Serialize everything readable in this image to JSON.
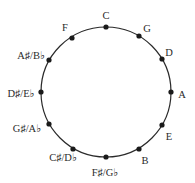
{
  "diagram": {
    "circle": {
      "cx": 106,
      "cy": 92,
      "r": 65,
      "stroke": "#2a2a2a"
    },
    "dot_color": "#1a1a1a",
    "notes": [
      {
        "label": "C",
        "dot": [
          106,
          27
        ],
        "text": [
          106,
          17
        ]
      },
      {
        "label": "G",
        "dot": [
          139,
          36
        ],
        "text": [
          147,
          30
        ]
      },
      {
        "label": "D",
        "dot": [
          162,
          59
        ],
        "text": [
          169,
          54
        ]
      },
      {
        "label": "A",
        "dot": [
          171,
          92
        ],
        "text": [
          182,
          96
        ]
      },
      {
        "label": "E",
        "dot": [
          162,
          125
        ],
        "text": [
          169,
          138
        ]
      },
      {
        "label": "B",
        "dot": [
          139,
          149
        ],
        "text": [
          145,
          162
        ]
      },
      {
        "label": "F♯/G♭",
        "dot": [
          106,
          157
        ],
        "text": [
          105,
          174
        ]
      },
      {
        "label": "C♯/D♭",
        "dot": [
          73,
          149
        ],
        "text": [
          63,
          159
        ]
      },
      {
        "label": "G♯/A♭",
        "dot": [
          49,
          124
        ],
        "text": [
          27,
          130
        ]
      },
      {
        "label": "D♯/E♭",
        "dot": [
          41,
          92
        ],
        "text": [
          21,
          95
        ]
      },
      {
        "label": "A♯/B♭",
        "dot": [
          49,
          60
        ],
        "text": [
          31,
          57
        ]
      },
      {
        "label": "F",
        "dot": [
          72,
          38
        ],
        "text": [
          65,
          29
        ]
      }
    ]
  }
}
